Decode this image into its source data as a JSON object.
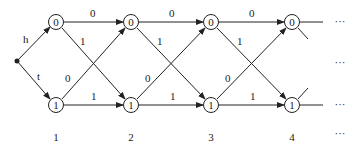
{
  "diagram": {
    "type": "trellis",
    "start": {
      "label_up": "h",
      "label_down": "t"
    },
    "columns": [
      {
        "label": "1",
        "top_state": "0",
        "bottom_state": "1"
      },
      {
        "label": "2",
        "top_state": "0",
        "bottom_state": "1"
      },
      {
        "label": "3",
        "top_state": "0",
        "bottom_state": "1"
      },
      {
        "label": "4",
        "top_state": "0",
        "bottom_state": "1"
      }
    ],
    "edge_labels": {
      "top_to_top": "0",
      "top_to_bottom": "1",
      "bottom_to_top": "0",
      "bottom_to_bottom": "1"
    },
    "continuation": "···",
    "colors": {
      "stroke": "#222222",
      "background": "#ffffff"
    }
  }
}
